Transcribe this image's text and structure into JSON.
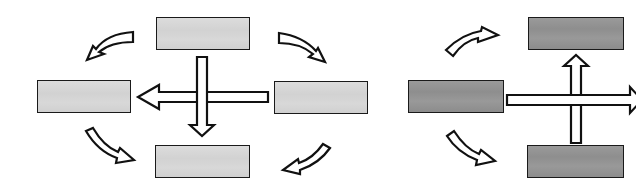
{
  "figure": {
    "colors": {
      "background": "#ffffff",
      "outline": "#111111",
      "light_box_fill": "#d6d6d6",
      "dark_box_fill": "#939393",
      "arrow_fill": "#ffffff"
    },
    "left_diagram": {
      "boxes": [
        {
          "id": "top",
          "shade": "light"
        },
        {
          "id": "left",
          "shade": "light"
        },
        {
          "id": "right",
          "shade": "light"
        },
        {
          "id": "bottom",
          "shade": "light"
        }
      ],
      "straight_arrows": [
        {
          "from": "right",
          "to": "left",
          "direction": "left"
        },
        {
          "from": "top",
          "to": "bottom",
          "direction": "down"
        }
      ],
      "curved_arrows": [
        {
          "position": "top-left",
          "direction": "toward-left-box"
        },
        {
          "position": "top-right",
          "direction": "toward-right-box"
        },
        {
          "position": "bottom-left",
          "direction": "toward-bottom-box"
        },
        {
          "position": "bottom-right",
          "direction": "toward-bottom-box"
        }
      ]
    },
    "right_diagram": {
      "boxes": [
        {
          "id": "top",
          "shade": "dark"
        },
        {
          "id": "left",
          "shade": "dark"
        },
        {
          "id": "bottom",
          "shade": "dark"
        }
      ],
      "straight_arrows": [
        {
          "from": "left",
          "to": "offscreen-right",
          "direction": "right"
        },
        {
          "from": "bottom",
          "to": "top",
          "direction": "up"
        }
      ],
      "curved_arrows": [
        {
          "position": "top-left",
          "direction": "toward-top-box"
        },
        {
          "position": "bottom-left",
          "direction": "toward-bottom-box"
        }
      ]
    }
  }
}
